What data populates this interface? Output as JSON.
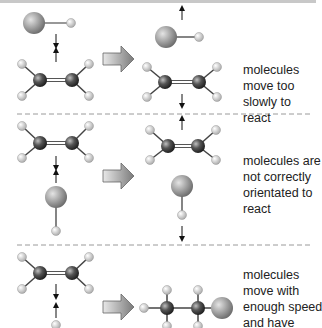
{
  "panels": [
    {
      "id": "slow",
      "caption_lines": [
        "molecules",
        "move too",
        "slowly to",
        "react"
      ]
    },
    {
      "id": "orientation",
      "caption_lines": [
        "molecules are",
        "not correctly",
        "orientated to",
        "react"
      ]
    },
    {
      "id": "success",
      "caption_lines": [
        "molecules",
        "move with",
        "enough speed",
        "and have"
      ]
    }
  ],
  "colors": {
    "carbon": "#2e2e2e",
    "hydrogen": "#d8d8d8",
    "halogen": "#9a9a9a",
    "arrow_fill": "#8a8a8a",
    "divider": "#9a9a9a",
    "text": "#222222"
  }
}
